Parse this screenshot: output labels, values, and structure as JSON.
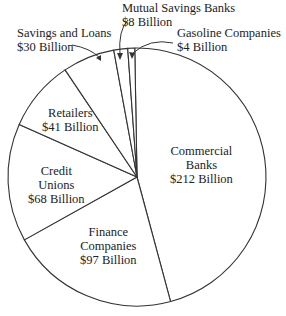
{
  "chart_data": {
    "type": "pie",
    "title": "",
    "units": "Billion dollars",
    "total": 460,
    "slices": [
      {
        "name": "Commercial Banks",
        "value": 212,
        "label_lines": [
          "Commercial",
          "Banks",
          "$212 Billion"
        ]
      },
      {
        "name": "Finance Companies",
        "value": 97,
        "label_lines": [
          "Finance",
          "Companies",
          "$97 Billion"
        ]
      },
      {
        "name": "Credit Unions",
        "value": 68,
        "label_lines": [
          "Credit",
          "Unions",
          "$68 Billion"
        ]
      },
      {
        "name": "Retailers",
        "value": 41,
        "label_lines": [
          "Retailers",
          "$41 Billion"
        ]
      },
      {
        "name": "Savings and Loans",
        "value": 30,
        "label_lines": [
          "Savings and Loans",
          "$30 Billion"
        ]
      },
      {
        "name": "Mutual Savings Banks",
        "value": 8,
        "label_lines": [
          "Mutual Savings Banks",
          "$8 Billion"
        ]
      },
      {
        "name": "Gasoline Companies",
        "value": 4,
        "label_lines": [
          "Gasoline Companies",
          "$4 Billion"
        ]
      }
    ],
    "start_angle_deg": -91,
    "direction": "clockwise",
    "colors": {
      "stroke": "#333333",
      "fill": "#ffffff",
      "text": "#222222"
    }
  }
}
